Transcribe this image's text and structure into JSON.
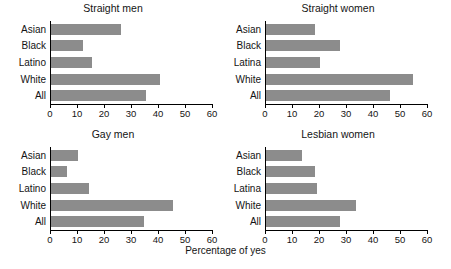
{
  "chart_data": {
    "type": "bar",
    "title": "",
    "xlabel": "Percentage of yes",
    "ylabel": "",
    "xlim": [
      0,
      60
    ],
    "xticks": [
      0,
      10,
      20,
      30,
      40,
      50,
      60
    ],
    "grid": false,
    "legend": null,
    "orientation": "horizontal",
    "bar_color": "#8c8c8c",
    "axis_color": "#000000",
    "panels": [
      {
        "title": "Straight men",
        "categories": [
          "Asian",
          "Black",
          "Latino",
          "White",
          "All"
        ],
        "values": [
          26,
          12,
          15,
          40.5,
          35
        ]
      },
      {
        "title": "Straight women",
        "categories": [
          "Asian",
          "Black",
          "Latina",
          "White",
          "All"
        ],
        "values": [
          18,
          27.5,
          20,
          54.5,
          46
        ]
      },
      {
        "title": "Gay men",
        "categories": [
          "Asian",
          "Black",
          "Latino",
          "White",
          "All"
        ],
        "values": [
          10,
          6,
          14,
          45,
          34.5
        ]
      },
      {
        "title": "Lesbian women",
        "categories": [
          "Asian",
          "Black",
          "Latina",
          "White",
          "All"
        ],
        "values": [
          13.5,
          18,
          19,
          33.5,
          27.5
        ]
      }
    ]
  }
}
